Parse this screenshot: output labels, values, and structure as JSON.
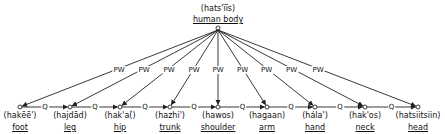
{
  "root": {
    "phonetic": "(hats'ïïs)",
    "gloss": "human body",
    "x": 218,
    "y": 28
  },
  "nodes": [
    {
      "phonetic": "(hakēē')",
      "gloss": "foot",
      "x": 20
    },
    {
      "phonetic": "(hajdād)",
      "gloss": "leg",
      "x": 70
    },
    {
      "phonetic": "(hak'a(́)",
      "gloss": "hip",
      "x": 120
    },
    {
      "phonetic": "(hazhi')",
      "gloss": "trunk",
      "x": 170
    },
    {
      "phonetic": "(hawos)",
      "gloss": "shoulder",
      "x": 218
    },
    {
      "phonetic": "(hagaan)",
      "gloss": "arm",
      "x": 267
    },
    {
      "phonetic": "(hála')",
      "gloss": "hand",
      "x": 315
    },
    {
      "phonetic": "(hak'os)",
      "gloss": "neck",
      "x": 365
    },
    {
      "phonetic": "(hatsiitsiin)",
      "gloss": "head",
      "x": 418
    }
  ],
  "node_y": 107,
  "relation_labels": {
    "part_whole": "PW",
    "sequence": "Q"
  },
  "colors": {
    "line": "#222222",
    "text": "#111111",
    "background": "#ffffff"
  }
}
